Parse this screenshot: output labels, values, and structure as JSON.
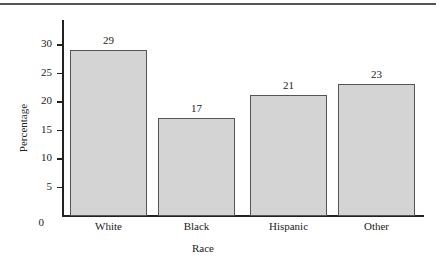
{
  "chart_data": {
    "type": "bar",
    "title": "",
    "xlabel": "Race",
    "ylabel": "Percentage",
    "categories": [
      "White",
      "Black",
      "Hispanic",
      "Other"
    ],
    "values": [
      29,
      17,
      21,
      23
    ],
    "value_labels": [
      "29",
      "17",
      "21",
      "23"
    ],
    "yticks": [
      "0",
      "5",
      "10",
      "15",
      "20",
      "25",
      "30"
    ],
    "ylim": [
      0,
      32
    ],
    "grid": false,
    "legend": null,
    "bar_color": "#d4d4d4",
    "edge_color": "#555555"
  }
}
